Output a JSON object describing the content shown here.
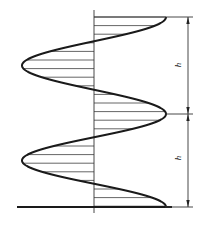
{
  "diagram": {
    "labels": {
      "period_upper": "h",
      "period_lower": "h"
    },
    "geometry": {
      "axis_x": 94,
      "amplitude": 72,
      "top_y": 17,
      "mid_y": 114,
      "bottom_y": 207,
      "dim_x": 188
    },
    "colors": {
      "line": "#1a1a1a",
      "hatch": "#555555",
      "background": "#ffffff"
    }
  }
}
